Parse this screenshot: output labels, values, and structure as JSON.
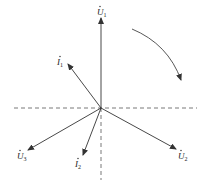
{
  "diagram": {
    "type": "phasor-diagram",
    "colors": {
      "stroke": "#333333",
      "axis": "#555555",
      "text": "#222222"
    },
    "origin": [
      101,
      108
    ],
    "axes": {
      "horizontal": {
        "x1": 14,
        "x2": 197,
        "y": 108,
        "style": "dashed"
      },
      "vertical": {
        "x": 101,
        "y1": 108,
        "y2": 180,
        "style": "dashed"
      }
    },
    "phasors": [
      {
        "id": "U1",
        "symbol": "U",
        "dot": true,
        "subscript": "1",
        "to": [
          101,
          18
        ],
        "label_pos": [
          97,
          15
        ]
      },
      {
        "id": "I1",
        "symbol": "I",
        "dot": true,
        "subscript": "1",
        "to": [
          68,
          64
        ],
        "label_pos": [
          57,
          65
        ]
      },
      {
        "id": "U3",
        "symbol": "U",
        "dot": true,
        "subscript": "3",
        "to": [
          28,
          150
        ],
        "label_pos": [
          17,
          159
        ]
      },
      {
        "id": "I2",
        "symbol": "I",
        "dot": true,
        "subscript": "2",
        "to": [
          83,
          155
        ],
        "label_pos": [
          75,
          167
        ]
      },
      {
        "id": "U2",
        "symbol": "U",
        "dot": true,
        "subscript": "2",
        "to": [
          176,
          149
        ],
        "label_pos": [
          178,
          159
        ]
      }
    ],
    "rotation_arrow": {
      "direction": "clockwise",
      "path": "M132 29 Q168 44 181 80"
    }
  }
}
